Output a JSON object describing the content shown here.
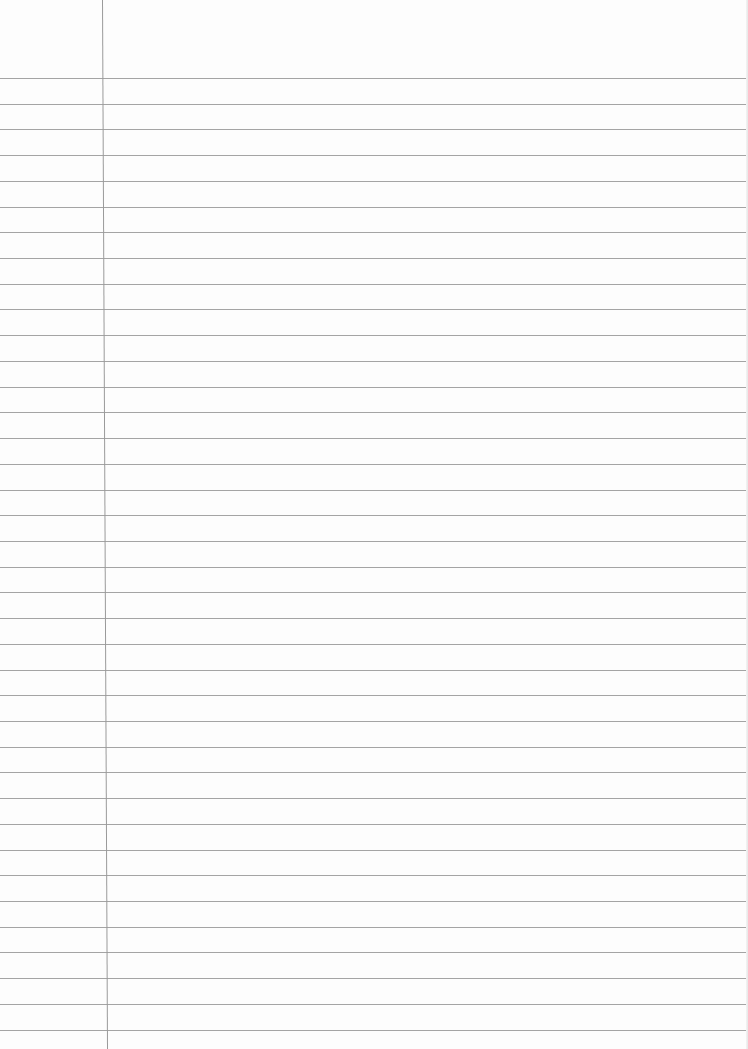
{
  "paper": {
    "type": "ruled-notebook-page",
    "background_color": "#fdfdfd",
    "rule_color": "#a4a4a4",
    "margin_color": "#9a9a9a",
    "rule_count": 38,
    "first_rule_y": 78,
    "rule_spacing": 25.72,
    "margin_x_top": 102,
    "margin_x_bottom": 107
  }
}
